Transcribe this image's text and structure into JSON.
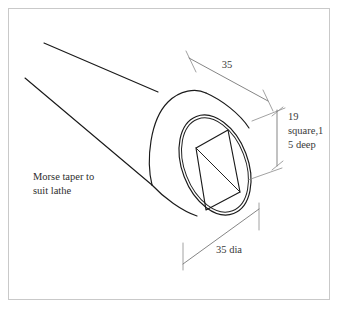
{
  "drawing": {
    "title": "Morse taper square-socket arbor isometric drawing",
    "background_color": "#ffffff",
    "frame_color": "#c9c9c9",
    "line_color": "#1a1a1a",
    "dimension_color": "#6f6f6f",
    "text_color": "#2e2e2e",
    "annotations": {
      "note_line_1": "Morse taper to",
      "note_line_2": "suit lathe",
      "length_dim": "35",
      "socket_line_1": "19",
      "socket_line_2": "square,1",
      "socket_line_3": "5 deep",
      "diameter_dim": "35 dia"
    }
  }
}
